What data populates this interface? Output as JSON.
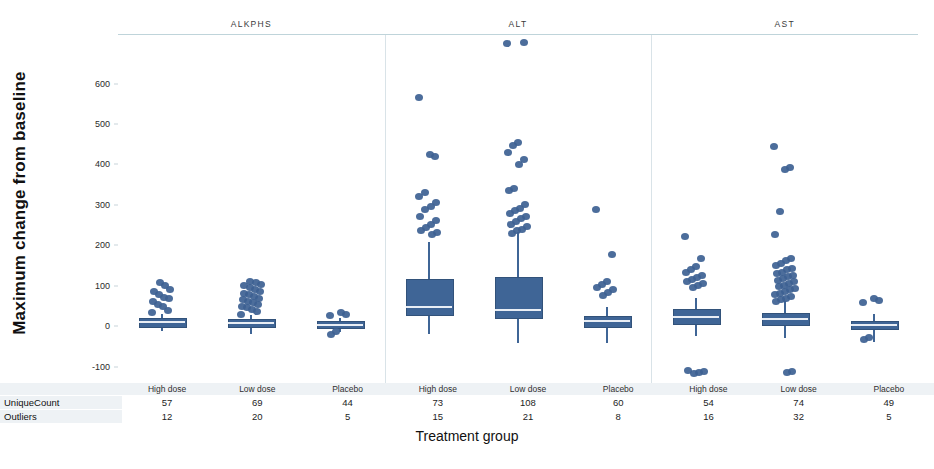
{
  "axis": {
    "y_title": "Maximum change from baseline",
    "x_title": "Treatment group",
    "y_ticks": [
      "600",
      "500",
      "400",
      "300",
      "200",
      "100",
      "0",
      "-100"
    ]
  },
  "panels": [
    {
      "title": "ALKPHS"
    },
    {
      "title": "ALT"
    },
    {
      "title": "AST"
    }
  ],
  "table": {
    "row_labels": [
      "UniqueCount",
      "Outliers"
    ],
    "group_headers": [
      "High dose",
      "Low dose",
      "Placebo",
      "High dose",
      "Low dose",
      "Placebo",
      "High dose",
      "Low dose",
      "Placebo"
    ],
    "unique_count": [
      "57",
      "69",
      "44",
      "73",
      "108",
      "60",
      "54",
      "74",
      "49"
    ],
    "outliers": [
      "12",
      "20",
      "5",
      "15",
      "21",
      "8",
      "16",
      "32",
      "5"
    ]
  },
  "colors": {
    "series": "#3f6596",
    "box_stroke": "#32527a",
    "median": "#e9eef5",
    "frame": "#bfd4da",
    "header_bg": "#eef2f5"
  },
  "chart_data": {
    "type": "box",
    "title": "",
    "xlabel": "Treatment group",
    "ylabel": "Maximum change from baseline",
    "ylim": [
      -140,
      720
    ],
    "yticks": [
      -100,
      0,
      100,
      200,
      300,
      400,
      500,
      600
    ],
    "grid": false,
    "legend": "none",
    "panels": [
      {
        "name": "ALKPHS",
        "groups": [
          {
            "label": "High dose",
            "unique_count": 57,
            "outlier_count": 12,
            "whisker_low": -12,
            "q1": 2,
            "median": 10,
            "q3": 20,
            "whisker_high": 30,
            "outliers": [
              33,
              40,
              48,
              55,
              62,
              68,
              72,
              78,
              85,
              92,
              100,
              108
            ]
          },
          {
            "label": "Low dose",
            "unique_count": 69,
            "outlier_count": 20,
            "whisker_low": -18,
            "q1": 0,
            "median": 8,
            "q3": 18,
            "whisker_high": 28,
            "outliers": [
              30,
              36,
              42,
              46,
              50,
              54,
              58,
              62,
              66,
              70,
              74,
              78,
              82,
              86,
              90,
              95,
              100,
              104,
              108,
              112
            ]
          },
          {
            "label": "Placebo",
            "unique_count": 44,
            "outlier_count": 5,
            "whisker_low": -14,
            "q1": -2,
            "median": 4,
            "q3": 12,
            "whisker_high": 20,
            "outliers": [
              26,
              30,
              33,
              -12,
              -20
            ]
          }
        ]
      },
      {
        "name": "ALT",
        "groups": [
          {
            "label": "High dose",
            "unique_count": 73,
            "outlier_count": 15,
            "whisker_low": -18,
            "q1": 30,
            "median": 48,
            "q3": 118,
            "whisker_high": 208,
            "outliers": [
              565,
              420,
              425,
              330,
              322,
              305,
              295,
              288,
              272,
              262,
              252,
              245,
              238,
              232,
              226
            ]
          },
          {
            "label": "Low dose",
            "unique_count": 108,
            "outlier_count": 21,
            "whisker_low": -42,
            "q1": 22,
            "median": 40,
            "q3": 122,
            "whisker_high": 232,
            "outliers": [
              700,
              702,
              455,
              448,
              430,
              412,
              400,
              340,
              336,
              300,
              292,
              286,
              278,
              272,
              266,
              258,
              252,
              246,
              240,
              236,
              230
            ]
          },
          {
            "label": "Placebo",
            "unique_count": 60,
            "outlier_count": 8,
            "whisker_low": -40,
            "q1": 2,
            "median": 12,
            "q3": 26,
            "whisker_high": 48,
            "outliers": [
              288,
              178,
              112,
              104,
              96,
              90,
              84,
              76
            ]
          }
        ]
      },
      {
        "name": "AST",
        "groups": [
          {
            "label": "High dose",
            "unique_count": 54,
            "outlier_count": 16,
            "whisker_low": -25,
            "q1": 8,
            "median": 22,
            "q3": 42,
            "whisker_high": 70,
            "outliers": [
              222,
              168,
              148,
              140,
              132,
              126,
              120,
              116,
              112,
              106,
              100,
              96,
              -110,
              -112,
              -114,
              -116
            ]
          },
          {
            "label": "Low dose",
            "unique_count": 74,
            "outlier_count": 32,
            "whisker_low": -30,
            "q1": 6,
            "median": 18,
            "q3": 34,
            "whisker_high": 62,
            "outliers": [
              445,
              392,
              388,
              285,
              226,
              168,
              162,
              156,
              150,
              144,
              140,
              134,
              130,
              126,
              122,
              118,
              114,
              110,
              106,
              102,
              98,
              94,
              90,
              86,
              82,
              78,
              74,
              70,
              66,
              62,
              -112,
              -114
            ]
          },
          {
            "label": "Placebo",
            "unique_count": 49,
            "outlier_count": 5,
            "whisker_low": -38,
            "q1": -4,
            "median": 4,
            "q3": 14,
            "whisker_high": 30,
            "outliers": [
              58,
              64,
              70,
              -28,
              -32
            ]
          }
        ]
      }
    ]
  }
}
